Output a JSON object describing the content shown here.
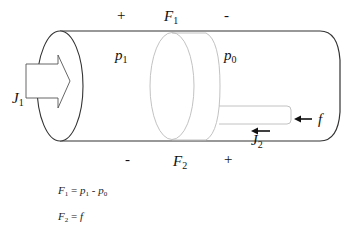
{
  "diagram": {
    "title": "",
    "top_labels": {
      "plus": "+",
      "force": "F",
      "force_sub": "1",
      "minus": "-"
    },
    "bottom_labels": {
      "minus": "-",
      "force": "F",
      "force_sub": "2",
      "plus": "+"
    },
    "chamber_labels": {
      "left_pressure": "p",
      "left_pressure_sub": "1",
      "right_pressure": "p",
      "right_pressure_sub": "0"
    },
    "flow_labels": {
      "inflow": "J",
      "inflow_sub": "1",
      "piston_flow": "J",
      "piston_flow_sub": "2",
      "rod_force": "f"
    },
    "equations": [
      {
        "lhs": "F",
        "lhs_sub": "1",
        "eq": " = ",
        "rhs_a": "p",
        "rhs_a_sub": "1",
        "op": " - ",
        "rhs_b": "p",
        "rhs_b_sub": "0"
      },
      {
        "lhs": "F",
        "lhs_sub": "2",
        "eq": " = ",
        "rhs": "f"
      }
    ],
    "colors": {
      "cylinder_stroke": "#333333",
      "piston_stroke": "#b5b5b5",
      "arrow": "#111111",
      "text": "#111111"
    }
  }
}
